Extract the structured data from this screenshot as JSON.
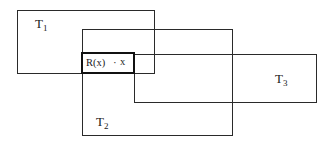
{
  "diagram": {
    "type": "overlapping-rectangles",
    "rectangles": [
      {
        "id": "T1",
        "label_main": "T",
        "label_sub": "1",
        "x": 17,
        "y": 10,
        "w": 137,
        "h": 63
      },
      {
        "id": "T2",
        "label_main": "T",
        "label_sub": "2",
        "x": 82,
        "y": 29,
        "w": 150,
        "h": 106
      },
      {
        "id": "T3",
        "label_main": "T",
        "label_sub": "3",
        "x": 134,
        "y": 54,
        "w": 182,
        "h": 48
      }
    ],
    "region": {
      "id": "R",
      "label": "R(x)",
      "point_marker": "·",
      "point_label": "x",
      "x": 82,
      "y": 53,
      "w": 52,
      "h": 20
    },
    "colors": {
      "line": "#2a2a2a",
      "background": "#ffffff"
    }
  }
}
